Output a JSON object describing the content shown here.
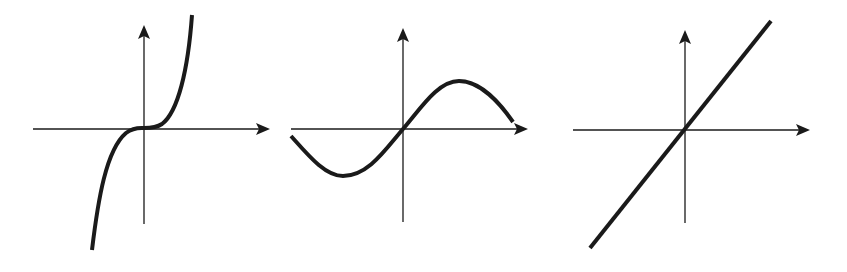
{
  "figure": {
    "panels": [
      {
        "name": "cubic",
        "shape": "cubic x^3",
        "colors": {
          "curve": "#1a1a1a",
          "axis": "#1a1a1a"
        }
      },
      {
        "name": "sine",
        "shape": "sine wave",
        "colors": {
          "curve": "#1a1a1a",
          "axis": "#1a1a1a"
        }
      },
      {
        "name": "linear",
        "shape": "straight line y=x",
        "colors": {
          "curve": "#1a1a1a",
          "axis": "#1a1a1a"
        }
      }
    ],
    "background": "#ffffff"
  }
}
